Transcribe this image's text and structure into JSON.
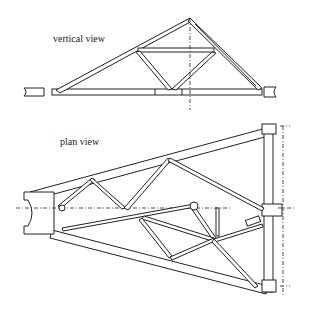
{
  "labels": {
    "vertical_view": "vertical view",
    "plan_view": "plan view"
  },
  "diagram": {
    "type": "truss engineering drawing",
    "views": [
      "vertical view",
      "plan view"
    ]
  }
}
